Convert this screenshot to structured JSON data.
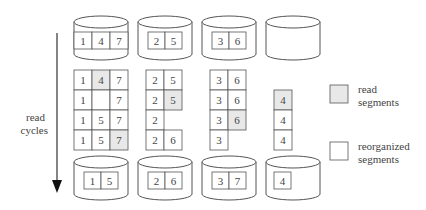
{
  "colors": {
    "read": "#e8e8e8",
    "reorganized": "#ffffff",
    "stroke": "#555555"
  },
  "arrow_label": [
    "read",
    "cycles"
  ],
  "legend": [
    {
      "type": "read",
      "label": [
        "read",
        "segments"
      ]
    },
    {
      "type": "reorganized",
      "label": [
        "reorganized",
        "segments"
      ]
    }
  ],
  "top_disks": [
    {
      "segments": [
        "1",
        "4",
        "7"
      ]
    },
    {
      "segments": [
        "2",
        "5"
      ]
    },
    {
      "segments": [
        "3",
        "6"
      ]
    },
    {
      "segments": []
    }
  ],
  "grids": [
    {
      "rows": [
        [
          {
            "v": "1",
            "read": false
          },
          {
            "v": "4",
            "read": true
          },
          {
            "v": "7",
            "read": false
          }
        ],
        [
          {
            "v": "1",
            "read": false
          },
          {
            "v": "",
            "read": false
          },
          {
            "v": "7",
            "read": false
          }
        ],
        [
          {
            "v": "1",
            "read": false
          },
          {
            "v": "5",
            "read": false
          },
          {
            "v": "7",
            "read": false
          }
        ],
        [
          {
            "v": "1",
            "read": false
          },
          {
            "v": "5",
            "read": false
          },
          {
            "v": "7",
            "read": true
          }
        ]
      ]
    },
    {
      "rows": [
        [
          {
            "v": "2",
            "read": false
          },
          {
            "v": "5",
            "read": false
          }
        ],
        [
          {
            "v": "2",
            "read": false
          },
          {
            "v": "5",
            "read": true
          }
        ],
        [
          {
            "v": "2",
            "read": false
          },
          null
        ],
        [
          {
            "v": "2",
            "read": false
          },
          {
            "v": "6",
            "read": false
          }
        ]
      ]
    },
    {
      "rows": [
        [
          {
            "v": "3",
            "read": false
          },
          {
            "v": "6",
            "read": false
          }
        ],
        [
          {
            "v": "3",
            "read": false
          },
          {
            "v": "6",
            "read": false
          }
        ],
        [
          {
            "v": "3",
            "read": false
          },
          {
            "v": "6",
            "read": true
          }
        ],
        [
          {
            "v": "3",
            "read": false
          },
          null
        ]
      ]
    },
    {
      "rows": [
        [
          null
        ],
        [
          {
            "v": "4",
            "read": true
          }
        ],
        [
          {
            "v": "4",
            "read": false
          }
        ],
        [
          {
            "v": "4",
            "read": false
          }
        ]
      ]
    }
  ],
  "bottom_disks": [
    {
      "segments": [
        "1",
        "5"
      ]
    },
    {
      "segments": [
        "2",
        "6"
      ]
    },
    {
      "segments": [
        "3",
        "7"
      ]
    },
    {
      "segments": [
        "4"
      ]
    }
  ]
}
